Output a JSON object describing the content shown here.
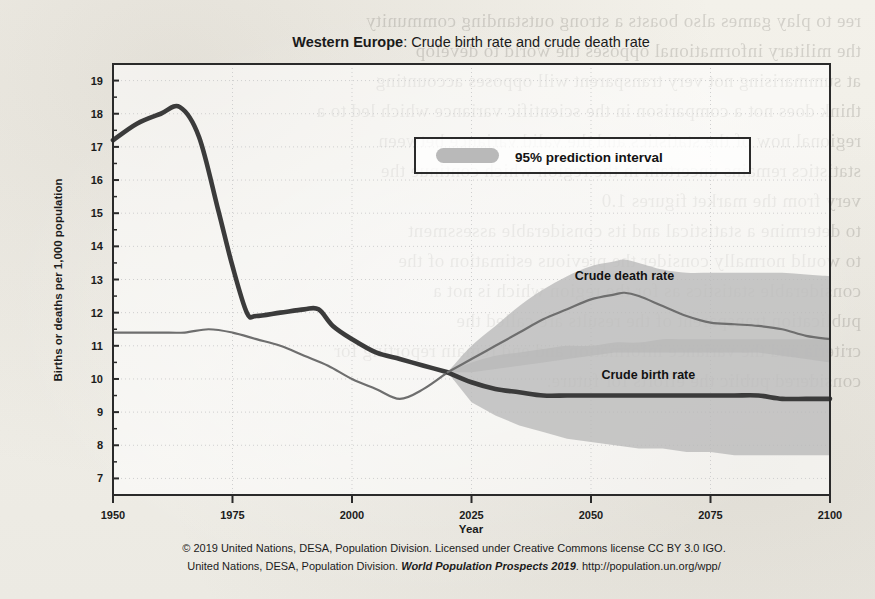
{
  "figure": {
    "title_region": "Western Europe",
    "title_rest": ": Crude birth rate and crude death rate",
    "legend": {
      "label": "95% prediction interval",
      "swatch_color": "#b9b9b9"
    },
    "series_labels": {
      "death": "Crude death rate",
      "birth": "Crude birth rate"
    },
    "footer_line1": "© 2019 United Nations, DESA, Population Division. Licensed under Creative Commons license CC BY 3.0 IGO.",
    "footer_line2_a": "United Nations, DESA, Population Division. ",
    "footer_line2_italic": "World Population Prospects 2019",
    "footer_line2_b": ". http://population.un.org/wpp/"
  },
  "chart_data": {
    "type": "line",
    "title": "Western Europe: Crude birth rate and crude death rate",
    "xlabel": "Year",
    "ylabel": "Births or deaths per 1,000 population",
    "xlim": [
      1950,
      2100
    ],
    "ylim": [
      6.5,
      19.5
    ],
    "xticks": [
      1950,
      1975,
      2000,
      2025,
      2050,
      2075,
      2100
    ],
    "yticks": [
      7,
      8,
      9,
      10,
      11,
      12,
      13,
      14,
      15,
      16,
      17,
      18,
      19
    ],
    "grid": true,
    "legend_position": "upper-center",
    "projection_start": 2020,
    "colors": {
      "birth_line": "#3b3b3b",
      "death_line": "#6e6e6e",
      "band": "#b9b9b9",
      "band_overlap": "#9a9a9a",
      "frame": "#2a2a2a",
      "grid": "#cfcfcf"
    },
    "series": [
      {
        "name": "Crude birth rate",
        "style": "thick",
        "x": [
          1950,
          1955,
          1960,
          1964,
          1968,
          1972,
          1975,
          1978,
          1980,
          1985,
          1990,
          1993,
          1996,
          2000,
          2005,
          2010,
          2015,
          2020
        ],
        "values": [
          17.2,
          17.7,
          18.0,
          18.2,
          17.3,
          15.1,
          13.4,
          12.0,
          11.9,
          12.0,
          12.1,
          12.1,
          11.6,
          11.2,
          10.8,
          10.6,
          10.4,
          10.2
        ]
      },
      {
        "name": "Crude death rate",
        "style": "thin",
        "x": [
          1950,
          1955,
          1960,
          1965,
          1970,
          1975,
          1980,
          1985,
          1990,
          1995,
          2000,
          2005,
          2010,
          2015,
          2020
        ],
        "values": [
          11.4,
          11.4,
          11.4,
          11.4,
          11.5,
          11.4,
          11.2,
          11.0,
          10.7,
          10.4,
          10.0,
          9.7,
          9.4,
          9.7,
          10.2
        ]
      }
    ],
    "projections": [
      {
        "name": "Crude birth rate",
        "style": "thick",
        "x": [
          2020,
          2025,
          2030,
          2035,
          2040,
          2045,
          2050,
          2055,
          2060,
          2065,
          2070,
          2075,
          2080,
          2085,
          2090,
          2095,
          2100
        ],
        "median": [
          10.2,
          9.9,
          9.7,
          9.6,
          9.5,
          9.5,
          9.5,
          9.5,
          9.5,
          9.5,
          9.5,
          9.5,
          9.5,
          9.5,
          9.4,
          9.4,
          9.4
        ],
        "lower95": [
          10.2,
          9.3,
          8.9,
          8.6,
          8.4,
          8.2,
          8.1,
          8.0,
          7.9,
          7.9,
          7.8,
          7.8,
          7.7,
          7.7,
          7.7,
          7.7,
          7.7
        ],
        "upper95": [
          10.2,
          10.5,
          10.7,
          10.8,
          10.9,
          11.0,
          11.0,
          11.1,
          11.1,
          11.2,
          11.2,
          11.2,
          11.2,
          11.2,
          11.2,
          11.2,
          11.2
        ]
      },
      {
        "name": "Crude death rate",
        "style": "thin",
        "x": [
          2020,
          2025,
          2030,
          2035,
          2040,
          2045,
          2050,
          2055,
          2057,
          2060,
          2065,
          2070,
          2075,
          2080,
          2085,
          2090,
          2095,
          2100
        ],
        "median": [
          10.2,
          10.6,
          11.0,
          11.4,
          11.8,
          12.1,
          12.4,
          12.55,
          12.6,
          12.5,
          12.2,
          11.9,
          11.7,
          11.65,
          11.6,
          11.5,
          11.3,
          11.2
        ],
        "lower95": [
          10.2,
          10.2,
          10.3,
          10.4,
          10.5,
          10.6,
          10.7,
          10.8,
          10.8,
          10.8,
          10.8,
          10.8,
          10.8,
          10.8,
          10.8,
          10.7,
          10.6,
          10.5
        ],
        "upper95": [
          10.2,
          11.0,
          11.6,
          12.2,
          12.7,
          13.1,
          13.4,
          13.55,
          13.6,
          13.5,
          13.3,
          13.2,
          13.2,
          13.2,
          13.2,
          13.2,
          13.15,
          13.1
        ]
      }
    ],
    "annotations": [
      {
        "text": "Crude death rate",
        "x": 2057,
        "y": 13.0
      },
      {
        "text": "Crude birth rate",
        "x": 2062,
        "y": 10.0
      }
    ]
  }
}
